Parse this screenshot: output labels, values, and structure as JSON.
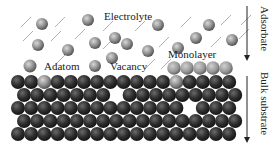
{
  "labels": {
    "electrolyte": "Electrolyte",
    "adatom": "Adatom",
    "vacancy": "Vacancy",
    "monolayer": "Monolayer",
    "adsorbate": "Adsorbate",
    "bulk_substrate": "Bulk substrate"
  },
  "colors": {
    "electrolyte_sphere": "#8a8a8a",
    "monolayer_sphere": "#9a9a9a",
    "substrate_sphere": "#2e2e2e",
    "adatom_sphere": "#8f8f8f",
    "slash": "#a8a8a8",
    "text": "#222222",
    "background": "#ffffff"
  },
  "electrolyte_spheres": [
    [
      42,
      24
    ],
    [
      88,
      20
    ],
    [
      158,
      25
    ],
    [
      209,
      25
    ],
    [
      38,
      45
    ],
    [
      68,
      50
    ],
    [
      95,
      43
    ],
    [
      115,
      38
    ],
    [
      127,
      44
    ],
    [
      148,
      51
    ],
    [
      178,
      48
    ],
    [
      196,
      38
    ],
    [
      232,
      40
    ],
    [
      112,
      58
    ]
  ],
  "slashes": [
    [
      26,
      22
    ],
    [
      60,
      22
    ],
    [
      108,
      26
    ],
    [
      140,
      26
    ],
    [
      186,
      22
    ],
    [
      226,
      20
    ],
    [
      246,
      20
    ],
    [
      28,
      36
    ],
    [
      56,
      36
    ],
    [
      80,
      34
    ],
    [
      108,
      44
    ],
    [
      164,
      42
    ],
    [
      216,
      42
    ],
    [
      60,
      60
    ],
    [
      150,
      64
    ],
    [
      166,
      64
    ],
    [
      244,
      34
    ]
  ],
  "adatom_spheres": [
    [
      30,
      66
    ]
  ],
  "vacancy_marker_sphere": [
    [
      95,
      66
    ]
  ],
  "monolayer_spheres": [
    [
      174,
      68
    ],
    [
      187,
      68
    ],
    [
      200,
      68
    ],
    [
      213,
      68
    ],
    [
      226,
      68
    ]
  ],
  "substrate": {
    "rows": [
      {
        "y": 82,
        "x_start": 18,
        "count": 18,
        "light_index": [
          2,
          12
        ],
        "gaps": []
      },
      {
        "y": 95,
        "x_start": 24,
        "count": 17,
        "light_index": [],
        "gaps": [
          7
        ]
      },
      {
        "y": 108,
        "x_start": 18,
        "count": 18,
        "light_index": [],
        "gaps": [
          13
        ]
      },
      {
        "y": 121,
        "x_start": 24,
        "count": 17,
        "light_index": [],
        "gaps": []
      },
      {
        "y": 134,
        "x_start": 18,
        "count": 18,
        "light_index": [],
        "gaps": []
      }
    ],
    "spacing": 13.2,
    "radius": 7
  }
}
